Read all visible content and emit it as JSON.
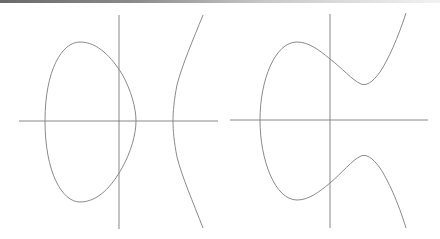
{
  "figure": {
    "panels": [
      {
        "name": "elliptic-curve-two-components",
        "description": "Elliptic curve with bounded oval and unbounded branch",
        "axes": {
          "x_axis": [
            19,
            121,
            218,
            121
          ],
          "y_axis": [
            119,
            15,
            119,
            229
          ]
        }
      },
      {
        "name": "elliptic-curve-one-component",
        "description": "Elliptic curve with single connected component",
        "axes": {
          "x_axis": [
            230,
            120,
            428,
            120
          ],
          "y_axis": [
            330,
            14,
            330,
            228
          ]
        }
      }
    ],
    "colors": {
      "axis": "#7a7a7a",
      "curve": "#8a8a8a",
      "background": "#ffffff"
    }
  }
}
